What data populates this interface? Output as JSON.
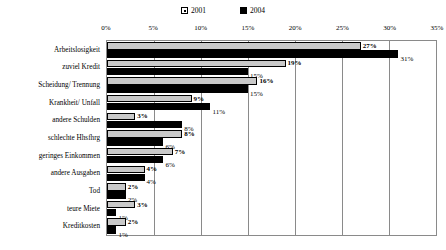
{
  "chart_data": {
    "type": "bar",
    "orientation": "horizontal",
    "title": "",
    "subtitle": "",
    "xlabel": "",
    "ylabel": "",
    "xlim": [
      0,
      35
    ],
    "xunit": "%",
    "grid": true,
    "legend_position": "top-center",
    "tick_labels": [
      "0%",
      "5%",
      "10%",
      "15%",
      "20%",
      "25%",
      "30%",
      "35%"
    ],
    "tick_values": [
      0,
      5,
      10,
      15,
      20,
      25,
      30,
      35
    ],
    "categories": [
      "Arbeitslosigkeit",
      "zuviel Kredit",
      "Scheidung/ Trennung",
      "Krankheit/ Unfall",
      "andere Schulden",
      "schlechte Hhsfhrg",
      "geringes Einkommen",
      "andere Ausgaben",
      "Tod",
      "teure Miete",
      "Kreditkosten"
    ],
    "series": [
      {
        "name": "2001",
        "color": "#c9c9c9",
        "values": [
          27,
          19,
          16,
          9,
          3,
          8,
          7,
          4,
          2,
          3,
          2
        ],
        "labels": [
          "27%",
          "19%",
          "16%",
          "9%",
          "3%",
          "8%",
          "7%",
          "4%",
          "2%",
          "3%",
          "2%"
        ]
      },
      {
        "name": "2004",
        "color": "#000000",
        "values": [
          31,
          15,
          15,
          11,
          8,
          6,
          6,
          4,
          2,
          1,
          1
        ],
        "labels": [
          "31%",
          "15%",
          "15%",
          "11%",
          "8%",
          "6%",
          "6%",
          "4%",
          "2%",
          "1%",
          "1%"
        ]
      }
    ]
  }
}
